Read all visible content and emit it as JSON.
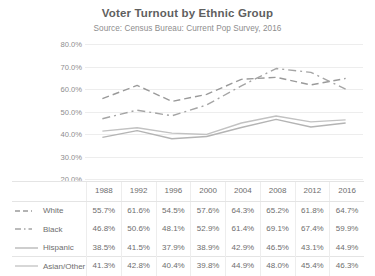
{
  "chart_data": {
    "type": "line",
    "title": "Voter Turnout by Ethnic Group",
    "subtitle": "Source: Census Bureau: Current Pop Survey, 2016",
    "xlabel": "",
    "ylabel": "",
    "grid": true,
    "legend_position": "table-left",
    "ylim": [
      20,
      80
    ],
    "ytick_labels": [
      "80.0%",
      "70.0%",
      "60.0%",
      "50.0%",
      "40.0%",
      "30.0%",
      "20.0%"
    ],
    "ytick_values": [
      80,
      70,
      60,
      50,
      40,
      30,
      20
    ],
    "categories": [
      "1988",
      "1992",
      "1996",
      "2000",
      "2004",
      "2008",
      "2012",
      "2016"
    ],
    "x": [
      1988,
      1992,
      1996,
      2000,
      2004,
      2008,
      2012,
      2016
    ],
    "series": [
      {
        "name": "White",
        "line_style": "dashed",
        "color": "#9a9a9a",
        "values": [
          55.7,
          61.6,
          54.5,
          57.6,
          64.3,
          65.2,
          61.8,
          64.7
        ],
        "labels": [
          "55.7%",
          "61.6%",
          "54.5%",
          "57.6%",
          "64.3%",
          "65.2%",
          "61.8%",
          "64.7%"
        ]
      },
      {
        "name": "Black",
        "line_style": "dash-dot",
        "color": "#a5a5a5",
        "values": [
          46.8,
          50.6,
          48.1,
          52.9,
          61.4,
          69.1,
          67.4,
          59.9
        ],
        "labels": [
          "46.8%",
          "50.6%",
          "48.1%",
          "52.9%",
          "61.4%",
          "69.1%",
          "67.4%",
          "59.9%"
        ]
      },
      {
        "name": "Hispanic",
        "line_style": "solid",
        "color": "#b4b4b4",
        "values": [
          38.5,
          41.5,
          37.9,
          38.9,
          42.9,
          46.5,
          43.1,
          44.9
        ],
        "labels": [
          "38.5%",
          "41.5%",
          "37.9%",
          "38.9%",
          "42.9%",
          "46.5%",
          "43.1%",
          "44.9%"
        ]
      },
      {
        "name": "Asian/Other",
        "line_style": "solid",
        "color": "#c2c2c2",
        "values": [
          41.3,
          42.8,
          40.4,
          39.8,
          44.9,
          48.0,
          45.4,
          46.3
        ],
        "labels": [
          "41.3%",
          "42.8%",
          "40.4%",
          "39.8%",
          "44.9%",
          "48.0%",
          "45.4%",
          "46.3%"
        ]
      }
    ]
  },
  "table": {
    "header": [
      "1988",
      "1992",
      "1996",
      "2000",
      "2004",
      "2008",
      "2012",
      "2016"
    ],
    "rows": [
      {
        "label": "White",
        "values": [
          "55.7%",
          "61.6%",
          "54.5%",
          "57.6%",
          "64.3%",
          "65.2%",
          "61.8%",
          "64.7%"
        ]
      },
      {
        "label": "Black",
        "values": [
          "46.8%",
          "50.6%",
          "48.1%",
          "52.9%",
          "61.4%",
          "69.1%",
          "67.4%",
          "59.9%"
        ]
      },
      {
        "label": "Hispanic",
        "values": [
          "38.5%",
          "41.5%",
          "37.9%",
          "38.9%",
          "42.9%",
          "46.5%",
          "43.1%",
          "44.9%"
        ]
      },
      {
        "label": "Asian/Other",
        "values": [
          "41.3%",
          "42.8%",
          "40.4%",
          "39.8%",
          "44.9%",
          "48.0%",
          "45.4%",
          "46.3%"
        ]
      }
    ]
  },
  "colors": {
    "background": "#ffffff",
    "title_text": "#5f5f5f",
    "body_text": "#6e6e6e",
    "axis_text": "#8d8d8d",
    "gridline": "#ededed",
    "table_border": "#e4e4e4"
  }
}
